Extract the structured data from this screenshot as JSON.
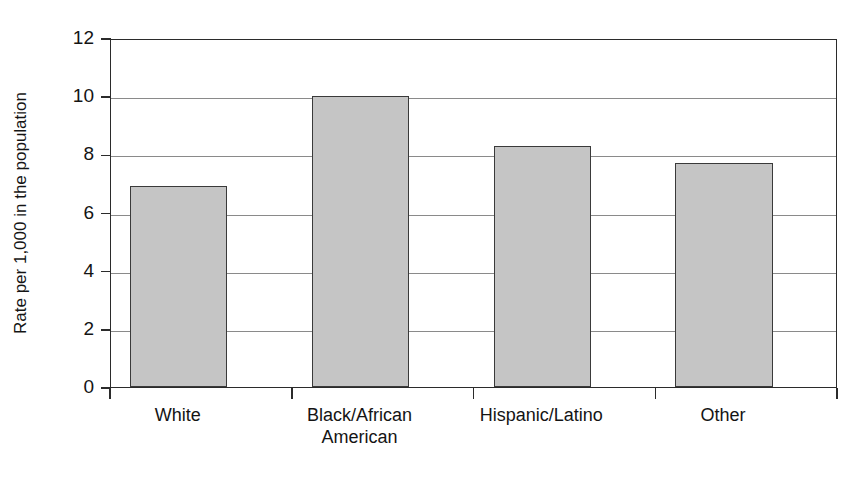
{
  "figure": {
    "background_color": "#ffffff",
    "bar_fill_color": "#c5c5c5",
    "bar_edge_color": "#3a3a3a",
    "axis_color": "#2b2b2b",
    "grid_color": "#8a8a8a"
  },
  "chart_data": {
    "type": "bar",
    "title": "",
    "subtitle": "",
    "xlabel": "",
    "ylabel": "Rate per 1,000 in the population",
    "categories": [
      "White",
      "Black/African American",
      "Hispanic/Latino",
      "Other"
    ],
    "category_lines": [
      [
        "White"
      ],
      [
        "Black/African",
        "American"
      ],
      [
        "Hispanic/Latino"
      ],
      [
        "Other"
      ]
    ],
    "values": [
      6.9,
      10.0,
      8.3,
      7.7
    ],
    "ylim": [
      0,
      12
    ],
    "ytick_values": [
      0,
      2,
      4,
      6,
      8,
      10,
      12
    ],
    "ytick_labels": [
      "0",
      "2",
      "4",
      "6",
      "8",
      "10",
      "12"
    ],
    "grid": true,
    "grid_axis": "y",
    "legend": false,
    "legend_position": "none",
    "annotations": []
  }
}
